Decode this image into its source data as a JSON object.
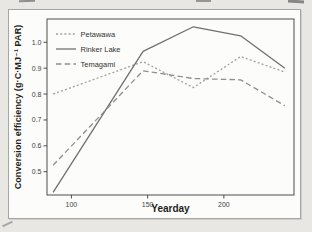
{
  "chart_data": {
    "type": "line",
    "x": [
      88,
      147,
      180,
      211,
      240
    ],
    "series": [
      {
        "name": "Petawawa",
        "values": [
          0.8,
          0.925,
          0.825,
          0.945,
          0.885
        ],
        "color": "#a0a0a0",
        "dash": "2 2.2"
      },
      {
        "name": "Rinker Lake",
        "values": [
          0.42,
          0.965,
          1.06,
          1.025,
          0.9
        ],
        "color": "#707070",
        "dash": ""
      },
      {
        "name": "Temagami",
        "values": [
          0.525,
          0.89,
          0.86,
          0.855,
          0.755
        ],
        "color": "#8f8f8f",
        "dash": "5.5 3.2"
      }
    ],
    "title": "",
    "xlabel": "Yearday",
    "ylabel": "Conversion efficiency (g·C·MJ⁻¹ PAR)",
    "xlim": [
      84,
      246
    ],
    "ylim": [
      0.41,
      1.09
    ],
    "xticks": [
      100,
      150,
      200
    ],
    "yticks": [
      0.5,
      0.6,
      0.7,
      0.8,
      0.9,
      1.0
    ],
    "grid": false,
    "legend_position": "top-left",
    "axis_color": "#4d4d4d",
    "tick_label_color": "#3e3e3e"
  }
}
